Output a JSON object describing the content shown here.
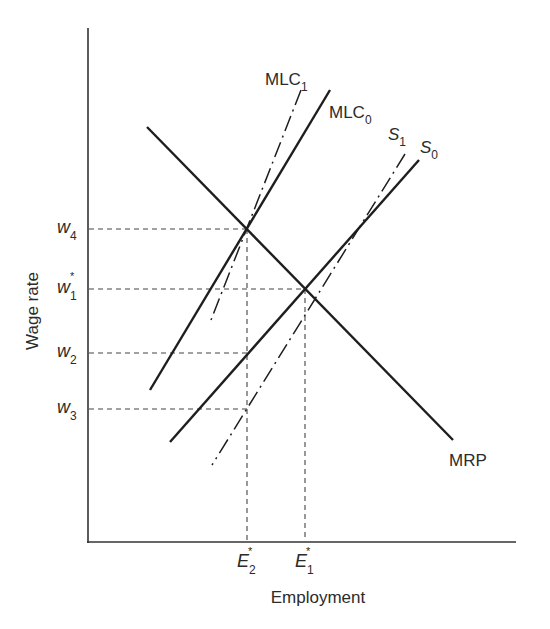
{
  "diagram": {
    "type": "monopsony labor market",
    "axes": {
      "y_label": "Wage rate",
      "x_label": "Employment"
    },
    "wage_levels": [
      {
        "id": "w4",
        "base": "w",
        "sub": "4",
        "sup": "",
        "y": 229
      },
      {
        "id": "w1star",
        "base": "w",
        "sub": "1",
        "sup": "*",
        "y": 289
      },
      {
        "id": "w2",
        "base": "w",
        "sub": "2",
        "sup": "",
        "y": 353
      },
      {
        "id": "w3",
        "base": "w",
        "sub": "3",
        "sup": "",
        "y": 409
      }
    ],
    "employment_levels": [
      {
        "id": "E2star",
        "base": "E",
        "sub": "2",
        "sup": "*",
        "x": 247
      },
      {
        "id": "E1star",
        "base": "E",
        "sub": "1",
        "sup": "*",
        "x": 305
      }
    ],
    "curves": [
      {
        "id": "MRP",
        "label": "MRP",
        "sub": "",
        "style": "solid"
      },
      {
        "id": "MLC0",
        "label": "MLC",
        "sub": "0",
        "style": "solid"
      },
      {
        "id": "MLC1",
        "label": "MLC",
        "sub": "1",
        "style": "dash-dot"
      },
      {
        "id": "S0",
        "label": "S",
        "sub": "0",
        "style": "solid"
      },
      {
        "id": "S1",
        "label": "S",
        "sub": "1",
        "style": "dash-dot"
      }
    ],
    "colors": {
      "line": "#1e1e1e",
      "text": "#2b2b2b",
      "background": "#ffffff"
    }
  }
}
